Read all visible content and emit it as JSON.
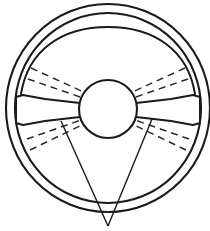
{
  "figure": {
    "background_color": "#ffffff",
    "line_color": "#1a1a1a",
    "dash_color": "#2b2b2b",
    "width": 210,
    "height": 231
  },
  "geometry": {
    "center": {
      "x": 108,
      "y": 108
    },
    "outer_rim": {
      "cx": 108,
      "cy": 108,
      "rx": 102,
      "ry": 104,
      "stroke_width": 2.1
    },
    "inner_rim": {
      "cx": 108,
      "cy": 108,
      "rx": 93,
      "ry": 95,
      "stroke_width": 2.1
    },
    "hub": {
      "cx": 108,
      "cy": 109,
      "r": 29,
      "stroke_width": 2.1
    },
    "spoke_left": {
      "outline": "M 16 98 L 22 96 L 44 100 L 79 103 L 79 117 L 44 120 L 22 124 L 16 122",
      "stroke_width": 2.0
    },
    "spoke_right": {
      "outline": "M 200 98 L 194 96 L 172 100 L 137 103 L 137 117 L 172 120 L 194 124 L 200 122",
      "stroke_width": 2.0
    },
    "upper_segment": {
      "path": "M 21 94 C 28 50 62 27 108 27 C 154 27 188 50 195 94",
      "stroke_width": 2.0
    },
    "v_lines": {
      "apex": {
        "x": 108,
        "y": 226
      },
      "left_start": {
        "x": 61,
        "y": 121
      },
      "right_start": {
        "x": 152,
        "y": 119
      },
      "stroke_width": 1.4
    },
    "dashed_lines": [
      {
        "quadrant": "upper-left",
        "x1": 31,
        "y1": 68,
        "x2": 88,
        "y2": 94,
        "label": "ul-outer"
      },
      {
        "quadrant": "upper-left",
        "x1": 28,
        "y1": 79,
        "x2": 86,
        "y2": 99,
        "label": "ul-inner"
      },
      {
        "quadrant": "upper-right",
        "x1": 185,
        "y1": 68,
        "x2": 128,
        "y2": 94,
        "label": "ur-outer"
      },
      {
        "quadrant": "upper-right",
        "x1": 188,
        "y1": 79,
        "x2": 130,
        "y2": 99,
        "label": "ur-inner"
      },
      {
        "quadrant": "lower-left",
        "x1": 30,
        "y1": 150,
        "x2": 86,
        "y2": 123,
        "label": "ll-outer"
      },
      {
        "quadrant": "lower-left",
        "x1": 27,
        "y1": 139,
        "x2": 84,
        "y2": 119,
        "label": "ll-inner"
      },
      {
        "quadrant": "lower-right",
        "x1": 186,
        "y1": 150,
        "x2": 130,
        "y2": 123,
        "label": "lr-outer"
      },
      {
        "quadrant": "lower-right",
        "x1": 189,
        "y1": 139,
        "x2": 132,
        "y2": 119,
        "label": "lr-inner"
      }
    ]
  },
  "dash_pattern": "7 5"
}
